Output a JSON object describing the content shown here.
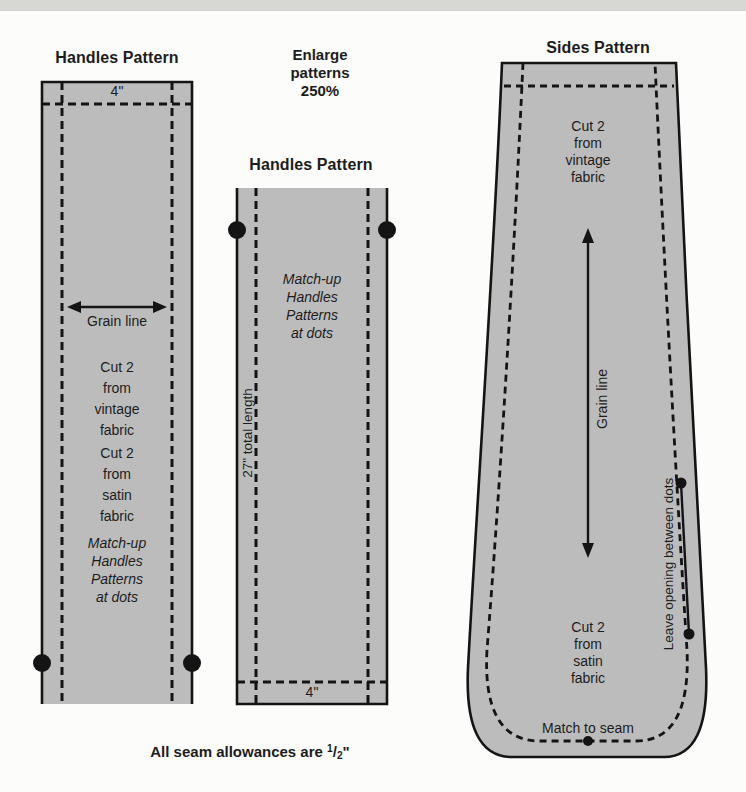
{
  "colors": {
    "pattern_fill": "#bcbcbc",
    "line": "#141414",
    "page_background": "#fcfcfa",
    "page_top_edge": "#d7d7d4"
  },
  "enlarge_note": "Enlarge\npatterns\n250%",
  "left_pattern": {
    "title": "Handles Pattern",
    "width_label": "4\"",
    "grain_label": "Grain line",
    "cut_vintage": "Cut 2\nfrom\nvintage\nfabric",
    "cut_satin": "Cut 2\nfrom\nsatin\nfabric",
    "match_note": "Match-up\nHandles\nPatterns\nat dots"
  },
  "middle_pattern": {
    "title": "Handles Pattern",
    "match_note": "Match-up\nHandles\nPatterns\nat dots",
    "length_label": "27\" total length",
    "width_label": "4\""
  },
  "sides_pattern": {
    "title": "Sides Pattern",
    "cut_vintage": "Cut 2\nfrom\nvintage\nfabric",
    "grain_label": "Grain line",
    "opening_label": "Leave opening between dots",
    "cut_satin": "Cut 2\nfrom\nsatin\nfabric",
    "match_seam_label": "Match to seam"
  },
  "footer": {
    "prefix": "All seam allowances are",
    "numerator": "1",
    "slash": "/",
    "denominator": "2",
    "unit": "\""
  }
}
